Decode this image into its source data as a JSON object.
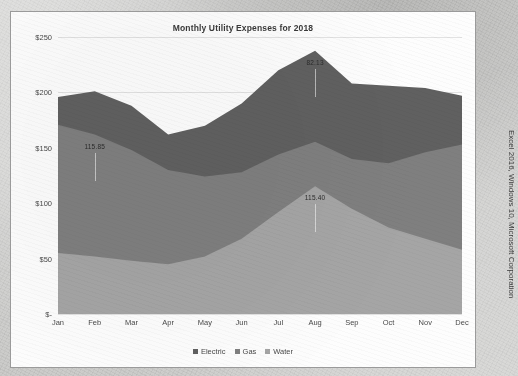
{
  "frame": {
    "credit": "Excel 2016, Windows 10, Microsoft Corporation"
  },
  "chart_data": {
    "type": "area",
    "stacked": true,
    "title": "Monthly Utility Expenses for 2018",
    "xlabel": "",
    "ylabel": "",
    "grid": true,
    "legend_position": "bottom",
    "ylim": [
      0,
      250
    ],
    "ytick_labels": [
      "$250",
      "$200",
      "$150",
      "$100",
      "$50",
      "$-"
    ],
    "ytick_values": [
      250,
      200,
      150,
      100,
      50,
      0
    ],
    "categories": [
      "Jan",
      "Feb",
      "Mar",
      "Apr",
      "May",
      "Jun",
      "Jul",
      "Aug",
      "Sep",
      "Oct",
      "Nov",
      "Dec"
    ],
    "series": [
      {
        "name": "Water",
        "color": "#a5a5a5",
        "values": [
          55.0,
          52.0,
          48.0,
          45.0,
          52.0,
          68.0,
          92.0,
          115.4,
          95.0,
          78.0,
          68.0,
          58.0
        ]
      },
      {
        "name": "Gas",
        "color": "#7f7f7f",
        "values": [
          115.85,
          110.0,
          100.0,
          85.0,
          72.0,
          60.0,
          52.0,
          40.0,
          45.0,
          58.0,
          78.0,
          95.0
        ]
      },
      {
        "name": "Electric",
        "color": "#606060",
        "values": [
          25.0,
          39.0,
          40.0,
          32.0,
          46.0,
          62.0,
          76.0,
          82.13,
          68.0,
          70.0,
          58.0,
          44.0
        ]
      }
    ],
    "annotations": [
      {
        "text": "115.85",
        "series": "Gas",
        "category": "Feb",
        "value": 115.85
      },
      {
        "text": "82.13",
        "series": "Electric",
        "category": "Aug",
        "value": 82.13
      },
      {
        "text": "115.40",
        "series": "Water",
        "category": "Aug",
        "value": 115.4
      }
    ],
    "legend": [
      {
        "label": "Electric",
        "color": "#606060"
      },
      {
        "label": "Gas",
        "color": "#7f7f7f"
      },
      {
        "label": "Water",
        "color": "#a5a5a5"
      }
    ]
  }
}
